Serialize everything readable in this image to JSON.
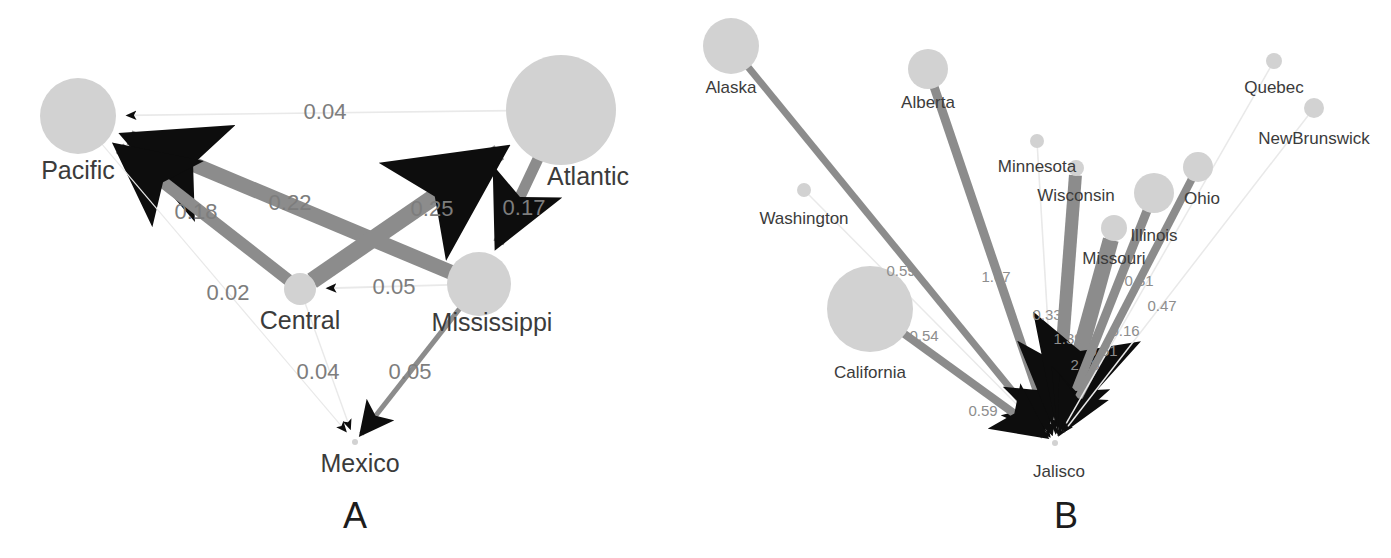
{
  "figure": {
    "background_color": "#ffffff",
    "node_color": "#d2d2d2",
    "edge_color": "#8c8c8c",
    "edge_faint_color": "#e9e9e9",
    "arrow_color": "#0d0d0d",
    "node_label_color": "#3b3b3b",
    "edge_label_color": "#7d7d7d"
  },
  "panels": [
    {
      "id": "panel-a",
      "letter": "A",
      "letter_pos": {
        "x": 355,
        "y": 518
      },
      "nodes": [
        {
          "name": "Pacific",
          "x": 78,
          "y": 116,
          "r": 38,
          "label_x": 78,
          "label_y": 172
        },
        {
          "name": "Atlantic",
          "x": 561,
          "y": 110,
          "r": 55,
          "label_x": 588,
          "label_y": 178
        },
        {
          "name": "Central",
          "x": 300,
          "y": 289,
          "r": 16,
          "label_x": 300,
          "label_y": 322
        },
        {
          "name": "Mississippi",
          "x": 479,
          "y": 284,
          "r": 32,
          "label_x": 492,
          "label_y": 324
        },
        {
          "name": "Mexico",
          "x": 355,
          "y": 442,
          "r": 3,
          "label_x": 360,
          "label_y": 465
        }
      ],
      "edges": [
        {
          "from": "Atlantic",
          "to": "Pacific",
          "value": "0.04",
          "width": 1.6,
          "faint": true,
          "label_x": 325,
          "label_y": 113
        },
        {
          "from": "Mississippi",
          "to": "Pacific",
          "value": "0.22",
          "width": 15,
          "faint": false,
          "label_x": 290,
          "label_y": 204
        },
        {
          "from": "Central",
          "to": "Pacific",
          "value": "0.18",
          "width": 12,
          "faint": false,
          "label_x": 196,
          "label_y": 213
        },
        {
          "from": "Central",
          "to": "Atlantic",
          "value": "0.25",
          "width": 17,
          "faint": false,
          "label_x": 432,
          "label_y": 210
        },
        {
          "from": "Atlantic",
          "to": "Mississippi",
          "value": "0.17",
          "width": 11,
          "faint": false,
          "label_x": 524,
          "label_y": 209
        },
        {
          "from": "Pacific",
          "to": "Mexico",
          "value": "0.02",
          "width": 1.2,
          "faint": true,
          "label_x": 228,
          "label_y": 294
        },
        {
          "from": "Mississippi",
          "to": "Central",
          "value": "0.05",
          "width": 1.8,
          "faint": true,
          "label_x": 394,
          "label_y": 288
        },
        {
          "from": "Central",
          "to": "Mexico",
          "value": "0.04",
          "width": 1.4,
          "faint": true,
          "label_x": 318,
          "label_y": 373
        },
        {
          "from": "Mississippi",
          "to": "Mexico",
          "value": "0.05",
          "width": 5,
          "faint": false,
          "label_x": 410,
          "label_y": 373
        }
      ]
    },
    {
      "id": "panel-b",
      "letter": "B",
      "letter_pos": {
        "x": 370,
        "y": 518
      },
      "hub": "Jalisco",
      "nodes": [
        {
          "name": "Jalisco",
          "x": 359,
          "y": 443,
          "r": 3,
          "label_x": 363,
          "label_y": 473
        },
        {
          "name": "Alaska",
          "x": 35,
          "y": 46,
          "r": 28,
          "label_x": 35,
          "label_y": 89
        },
        {
          "name": "Alberta",
          "x": 232,
          "y": 69,
          "r": 20,
          "label_x": 232,
          "label_y": 104
        },
        {
          "name": "Quebec",
          "x": 578,
          "y": 61,
          "r": 8,
          "label_x": 578,
          "label_y": 89
        },
        {
          "name": "NewBrunswick",
          "x": 618,
          "y": 108,
          "r": 10,
          "label_x": 618,
          "label_y": 140
        },
        {
          "name": "Minnesota",
          "x": 341,
          "y": 141,
          "r": 7,
          "label_x": 341,
          "label_y": 168
        },
        {
          "name": "Wisconsin",
          "x": 380,
          "y": 168,
          "r": 8,
          "label_x": 380,
          "label_y": 197
        },
        {
          "name": "Washington",
          "x": 108,
          "y": 190,
          "r": 7,
          "label_x": 108,
          "label_y": 220
        },
        {
          "name": "Ohio",
          "x": 502,
          "y": 167,
          "r": 15,
          "label_x": 506,
          "label_y": 200
        },
        {
          "name": "Illinois",
          "x": 458,
          "y": 193,
          "r": 20,
          "label_x": 458,
          "label_y": 237
        },
        {
          "name": "Missouri",
          "x": 418,
          "y": 228,
          "r": 13,
          "label_x": 418,
          "label_y": 260
        },
        {
          "name": "California",
          "x": 174,
          "y": 309,
          "r": 43,
          "label_x": 174,
          "label_y": 374
        }
      ],
      "edges": [
        {
          "from": "Alaska",
          "to": "Jalisco",
          "value": "0.59",
          "width": 7,
          "faint": false,
          "label_x": 205,
          "label_y": 272
        },
        {
          "from": "Alberta",
          "to": "Jalisco",
          "value": "1.07",
          "width": 9,
          "faint": false,
          "label_x": 300,
          "label_y": 278
        },
        {
          "from": "Washington",
          "to": "Jalisco",
          "value": "0.54",
          "width": 1.5,
          "faint": true,
          "label_x": 228,
          "label_y": 337
        },
        {
          "from": "California",
          "to": "Jalisco",
          "value": "0.59",
          "width": 8,
          "faint": false,
          "label_x": 287,
          "label_y": 412
        },
        {
          "from": "Minnesota",
          "to": "Jalisco",
          "value": "0.33",
          "width": 1.6,
          "faint": true,
          "label_x": 351,
          "label_y": 316
        },
        {
          "from": "Wisconsin",
          "to": "Jalisco",
          "value": "1.39",
          "width": 13,
          "faint": false,
          "label_x": 372,
          "label_y": 340
        },
        {
          "from": "Missouri",
          "to": "Jalisco",
          "value": "2.28",
          "width": 16,
          "faint": false,
          "label_x": 389,
          "label_y": 366
        },
        {
          "from": "Illinois",
          "to": "Jalisco",
          "value": "0.61",
          "width": 9,
          "faint": false,
          "label_x": 407,
          "label_y": 352
        },
        {
          "from": "Ohio",
          "to": "Jalisco",
          "value": "0.16",
          "width": 8,
          "faint": false,
          "label_x": 429,
          "label_y": 332
        },
        {
          "from": "Quebec",
          "to": "Jalisco",
          "value": "0.31",
          "width": 1.5,
          "faint": true,
          "label_x": 443,
          "label_y": 282
        },
        {
          "from": "NewBrunswick",
          "to": "Jalisco",
          "value": "0.47",
          "width": 1.5,
          "faint": true,
          "label_x": 466,
          "label_y": 307
        }
      ]
    }
  ]
}
